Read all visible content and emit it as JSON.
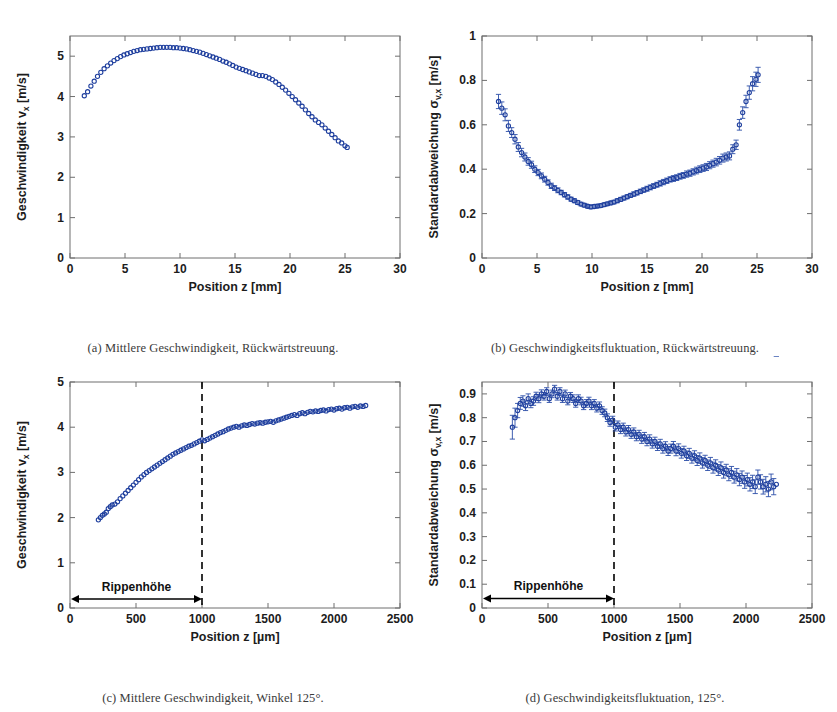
{
  "figure": {
    "background": "#ffffff",
    "series_color": "#1f3f9e",
    "marker_shape": "open-circle",
    "panels": [
      "a",
      "b",
      "c",
      "d"
    ]
  },
  "captions": {
    "a": "(a) Mittlere Geschwindigkeit, Rückwärtstreuung.",
    "b": "(b) Geschwindigkeitsfluktuation, Rückwärtstreuung.",
    "c": "(c) Mittlere Geschwindigkeit, Winkel 125°.",
    "d": "(d) Geschwindigkeitsfluktuation, 125°."
  },
  "annotations": {
    "rippenhoehe_label": "Rippenhöhe"
  },
  "chart_data": [
    {
      "id": "a",
      "type": "scatter",
      "title": "",
      "xlabel": "Position z [mm]",
      "ylabel": "Geschwindigkeit v",
      "ylabel_sub": "x",
      "ylabel_unit": " [m/s]",
      "xlim": [
        0,
        30
      ],
      "ylim": [
        0,
        5.5
      ],
      "xticks": [
        0,
        5,
        10,
        15,
        20,
        25,
        30
      ],
      "xticklabels": [
        "0",
        "5",
        "10",
        "15",
        "20",
        "25",
        "30"
      ],
      "yticks": [
        0,
        1,
        2,
        3,
        4,
        5
      ],
      "yticklabels": [
        "0",
        "1",
        "2",
        "3",
        "4",
        "5"
      ],
      "grid": false,
      "legend": "none",
      "errorbars": false,
      "x": [
        1.3,
        1.6,
        1.9,
        2.2,
        2.5,
        2.8,
        3.1,
        3.4,
        3.7,
        4.0,
        4.3,
        4.6,
        4.9,
        5.2,
        5.5,
        5.8,
        6.1,
        6.4,
        6.7,
        7.0,
        7.3,
        7.6,
        7.9,
        8.2,
        8.5,
        8.8,
        9.1,
        9.4,
        9.7,
        10.0,
        10.3,
        10.6,
        10.9,
        11.2,
        11.5,
        11.8,
        12.1,
        12.4,
        12.7,
        13.0,
        13.3,
        13.6,
        13.9,
        14.2,
        14.5,
        14.8,
        15.1,
        15.4,
        15.7,
        16.0,
        16.3,
        16.6,
        16.9,
        17.2,
        17.5,
        17.8,
        18.1,
        18.4,
        18.7,
        19.0,
        19.3,
        19.6,
        19.9,
        20.2,
        20.5,
        20.8,
        21.1,
        21.4,
        21.7,
        22.0,
        22.3,
        22.6,
        22.9,
        23.2,
        23.5,
        23.8,
        24.1,
        24.4,
        24.7,
        25.0,
        25.2
      ],
      "y": [
        4.02,
        4.12,
        4.26,
        4.38,
        4.5,
        4.6,
        4.69,
        4.76,
        4.83,
        4.89,
        4.94,
        4.99,
        5.03,
        5.06,
        5.09,
        5.12,
        5.14,
        5.16,
        5.17,
        5.18,
        5.19,
        5.2,
        5.21,
        5.22,
        5.22,
        5.22,
        5.22,
        5.21,
        5.21,
        5.2,
        5.19,
        5.18,
        5.16,
        5.14,
        5.12,
        5.1,
        5.07,
        5.04,
        5.01,
        4.98,
        4.95,
        4.92,
        4.88,
        4.85,
        4.81,
        4.77,
        4.73,
        4.7,
        4.67,
        4.64,
        4.61,
        4.58,
        4.55,
        4.52,
        4.52,
        4.5,
        4.46,
        4.42,
        4.36,
        4.3,
        4.23,
        4.16,
        4.08,
        4.0,
        3.92,
        3.84,
        3.76,
        3.67,
        3.58,
        3.5,
        3.42,
        3.36,
        3.3,
        3.22,
        3.14,
        3.06,
        2.98,
        2.9,
        2.85,
        2.78,
        2.74
      ]
    },
    {
      "id": "b",
      "type": "scatter",
      "title": "",
      "xlabel": "Position z [mm]",
      "ylabel": "Standardabweichung σ",
      "ylabel_sub": "v,x",
      "ylabel_unit": " [m/s]",
      "xlim": [
        0,
        30
      ],
      "ylim": [
        0,
        1
      ],
      "xticks": [
        0,
        5,
        10,
        15,
        20,
        25,
        30
      ],
      "xticklabels": [
        "0",
        "5",
        "10",
        "15",
        "20",
        "25",
        "30"
      ],
      "yticks": [
        0,
        0.2,
        0.4,
        0.6,
        0.8,
        1
      ],
      "yticklabels": [
        "0",
        "0.2",
        "0.4",
        "0.6",
        "0.8",
        "1"
      ],
      "grid": false,
      "legend": "none",
      "errorbars": true,
      "x": [
        1.5,
        1.8,
        2.1,
        2.4,
        2.7,
        3.0,
        3.3,
        3.6,
        3.9,
        4.2,
        4.5,
        4.8,
        5.1,
        5.4,
        5.7,
        6.0,
        6.3,
        6.6,
        6.9,
        7.2,
        7.5,
        7.8,
        8.1,
        8.4,
        8.7,
        9.0,
        9.3,
        9.6,
        9.9,
        10.2,
        10.5,
        10.8,
        11.1,
        11.4,
        11.7,
        12.0,
        12.3,
        12.6,
        12.9,
        13.2,
        13.5,
        13.8,
        14.1,
        14.4,
        14.7,
        15.0,
        15.3,
        15.6,
        15.9,
        16.2,
        16.5,
        16.8,
        17.1,
        17.4,
        17.7,
        18.0,
        18.3,
        18.6,
        18.9,
        19.2,
        19.5,
        19.8,
        20.1,
        20.4,
        20.7,
        21.0,
        21.3,
        21.6,
        21.9,
        22.2,
        22.5,
        22.8,
        23.1,
        23.4,
        23.7,
        24.0,
        24.3,
        24.6,
        24.9,
        25.1
      ],
      "y": [
        0.705,
        0.675,
        0.645,
        0.595,
        0.565,
        0.535,
        0.5,
        0.475,
        0.455,
        0.435,
        0.42,
        0.4,
        0.385,
        0.37,
        0.355,
        0.34,
        0.325,
        0.315,
        0.305,
        0.295,
        0.285,
        0.275,
        0.265,
        0.258,
        0.25,
        0.243,
        0.238,
        0.233,
        0.23,
        0.232,
        0.234,
        0.236,
        0.24,
        0.244,
        0.248,
        0.252,
        0.258,
        0.264,
        0.27,
        0.276,
        0.282,
        0.288,
        0.294,
        0.3,
        0.306,
        0.312,
        0.318,
        0.324,
        0.33,
        0.336,
        0.342,
        0.348,
        0.354,
        0.358,
        0.362,
        0.368,
        0.372,
        0.378,
        0.382,
        0.388,
        0.394,
        0.4,
        0.405,
        0.41,
        0.418,
        0.425,
        0.432,
        0.44,
        0.45,
        0.455,
        0.46,
        0.49,
        0.51,
        0.6,
        0.655,
        0.705,
        0.745,
        0.785,
        0.805,
        0.825
      ],
      "yerr": [
        0.032,
        0.028,
        0.027,
        0.025,
        0.022,
        0.021,
        0.02,
        0.019,
        0.018,
        0.017,
        0.016,
        0.015,
        0.014,
        0.013,
        0.013,
        0.012,
        0.012,
        0.011,
        0.011,
        0.01,
        0.01,
        0.01,
        0.009,
        0.009,
        0.009,
        0.008,
        0.008,
        0.008,
        0.008,
        0.008,
        0.008,
        0.008,
        0.008,
        0.008,
        0.008,
        0.008,
        0.009,
        0.009,
        0.009,
        0.009,
        0.009,
        0.01,
        0.01,
        0.01,
        0.01,
        0.011,
        0.011,
        0.011,
        0.011,
        0.012,
        0.012,
        0.012,
        0.012,
        0.013,
        0.013,
        0.013,
        0.013,
        0.014,
        0.014,
        0.014,
        0.015,
        0.015,
        0.015,
        0.016,
        0.016,
        0.016,
        0.017,
        0.017,
        0.018,
        0.018,
        0.018,
        0.02,
        0.021,
        0.024,
        0.026,
        0.028,
        0.03,
        0.032,
        0.032,
        0.034
      ]
    },
    {
      "id": "c",
      "type": "scatter",
      "title": "",
      "xlabel": "Position z [µm]",
      "ylabel": "Geschwindigkeit v",
      "ylabel_sub": "x",
      "ylabel_unit": " [m/s]",
      "xlim": [
        0,
        2500
      ],
      "ylim": [
        0,
        5
      ],
      "xticks": [
        0,
        500,
        1000,
        1500,
        2000,
        2500
      ],
      "xticklabels": [
        "0",
        "500",
        "1000",
        "1500",
        "2000",
        "2500"
      ],
      "yticks": [
        0,
        1,
        2,
        3,
        4,
        5
      ],
      "yticklabels": [
        "0",
        "1",
        "2",
        "3",
        "4",
        "5"
      ],
      "grid": false,
      "legend": "none",
      "errorbars": false,
      "reference_line_x": 1000,
      "annotation": {
        "label": "Rippenhöhe",
        "from_x": 0,
        "to_x": 1000,
        "at_y": 0.2
      },
      "x": [
        215,
        230,
        245,
        260,
        275,
        290,
        305,
        320,
        340,
        360,
        380,
        400,
        420,
        440,
        460,
        480,
        500,
        520,
        540,
        560,
        580,
        600,
        620,
        640,
        660,
        680,
        700,
        720,
        740,
        760,
        780,
        800,
        820,
        840,
        860,
        880,
        900,
        920,
        940,
        960,
        980,
        1000,
        1020,
        1040,
        1060,
        1080,
        1100,
        1120,
        1140,
        1160,
        1180,
        1200,
        1220,
        1240,
        1260,
        1280,
        1300,
        1320,
        1340,
        1360,
        1380,
        1400,
        1420,
        1440,
        1460,
        1480,
        1500,
        1520,
        1540,
        1560,
        1580,
        1600,
        1620,
        1640,
        1660,
        1680,
        1700,
        1720,
        1740,
        1760,
        1780,
        1800,
        1820,
        1840,
        1860,
        1880,
        1900,
        1920,
        1940,
        1960,
        1980,
        2000,
        2020,
        2040,
        2060,
        2080,
        2100,
        2120,
        2140,
        2160,
        2180,
        2200,
        2220,
        2240
      ],
      "y": [
        1.95,
        2.0,
        2.05,
        2.08,
        2.12,
        2.2,
        2.24,
        2.28,
        2.3,
        2.35,
        2.42,
        2.48,
        2.54,
        2.6,
        2.66,
        2.72,
        2.78,
        2.84,
        2.9,
        2.95,
        3.0,
        3.04,
        3.08,
        3.12,
        3.16,
        3.2,
        3.24,
        3.28,
        3.32,
        3.36,
        3.4,
        3.43,
        3.46,
        3.49,
        3.52,
        3.55,
        3.58,
        3.6,
        3.63,
        3.66,
        3.69,
        3.72,
        3.7,
        3.73,
        3.76,
        3.79,
        3.82,
        3.85,
        3.88,
        3.9,
        3.93,
        3.96,
        3.98,
        4.0,
        4.02,
        4.0,
        4.03,
        4.05,
        4.04,
        4.06,
        4.08,
        4.07,
        4.09,
        4.1,
        4.09,
        4.11,
        4.12,
        4.13,
        4.11,
        4.14,
        4.16,
        4.18,
        4.2,
        4.22,
        4.24,
        4.26,
        4.28,
        4.26,
        4.3,
        4.32,
        4.3,
        4.33,
        4.35,
        4.34,
        4.36,
        4.35,
        4.37,
        4.38,
        4.36,
        4.39,
        4.4,
        4.38,
        4.41,
        4.42,
        4.4,
        4.43,
        4.44,
        4.42,
        4.45,
        4.46,
        4.44,
        4.47,
        4.46,
        4.48
      ]
    },
    {
      "id": "d",
      "type": "scatter",
      "title": "",
      "xlabel": "Position z [µm]",
      "ylabel": "Standardabweichung σ",
      "ylabel_sub": "v,x",
      "ylabel_unit": " [m/s]",
      "xlim": [
        0,
        2500
      ],
      "ylim": [
        0,
        0.95
      ],
      "xticks": [
        0,
        500,
        1000,
        1500,
        2000,
        2500
      ],
      "xticklabels": [
        "0",
        "500",
        "1000",
        "1500",
        "2000",
        "2500"
      ],
      "yticks": [
        0,
        0.1,
        0.2,
        0.3,
        0.4,
        0.5,
        0.6,
        0.7,
        0.8,
        0.9
      ],
      "yticklabels": [
        "0",
        "0.1",
        "0.2",
        "0.3",
        "0.4",
        "0.5",
        "0.6",
        "0.7",
        "0.8",
        "0.9"
      ],
      "grid": false,
      "legend": "none",
      "errorbars": true,
      "reference_line_x": 1000,
      "annotation": {
        "label": "Rippenhöhe",
        "from_x": 0,
        "to_x": 1000,
        "at_y": 0.04
      },
      "x": [
        230,
        250,
        270,
        290,
        310,
        330,
        350,
        370,
        390,
        410,
        430,
        450,
        470,
        490,
        510,
        530,
        550,
        570,
        590,
        610,
        630,
        650,
        670,
        690,
        710,
        730,
        750,
        770,
        790,
        810,
        830,
        850,
        870,
        890,
        910,
        930,
        950,
        970,
        990,
        1010,
        1030,
        1050,
        1070,
        1090,
        1110,
        1130,
        1150,
        1170,
        1190,
        1210,
        1230,
        1250,
        1270,
        1290,
        1310,
        1330,
        1350,
        1370,
        1390,
        1410,
        1430,
        1450,
        1470,
        1490,
        1510,
        1530,
        1550,
        1570,
        1590,
        1610,
        1630,
        1650,
        1670,
        1690,
        1710,
        1730,
        1750,
        1770,
        1790,
        1810,
        1830,
        1850,
        1870,
        1890,
        1910,
        1930,
        1950,
        1970,
        1990,
        2010,
        2030,
        2050,
        2070,
        2090,
        2110,
        2130,
        2150,
        2170,
        2190,
        2210,
        2230
      ],
      "y": [
        0.76,
        0.8,
        0.83,
        0.86,
        0.87,
        0.85,
        0.88,
        0.86,
        0.87,
        0.89,
        0.88,
        0.9,
        0.89,
        0.91,
        0.88,
        0.9,
        0.92,
        0.89,
        0.91,
        0.88,
        0.9,
        0.87,
        0.89,
        0.88,
        0.86,
        0.88,
        0.87,
        0.85,
        0.86,
        0.87,
        0.85,
        0.86,
        0.84,
        0.85,
        0.83,
        0.82,
        0.8,
        0.78,
        0.79,
        0.76,
        0.77,
        0.75,
        0.76,
        0.74,
        0.75,
        0.73,
        0.74,
        0.72,
        0.73,
        0.71,
        0.72,
        0.7,
        0.71,
        0.69,
        0.7,
        0.68,
        0.69,
        0.67,
        0.68,
        0.66,
        0.67,
        0.68,
        0.66,
        0.67,
        0.65,
        0.66,
        0.64,
        0.65,
        0.63,
        0.64,
        0.62,
        0.63,
        0.61,
        0.62,
        0.6,
        0.61,
        0.59,
        0.6,
        0.58,
        0.59,
        0.57,
        0.58,
        0.56,
        0.57,
        0.55,
        0.56,
        0.54,
        0.55,
        0.53,
        0.54,
        0.52,
        0.53,
        0.51,
        0.55,
        0.53,
        0.51,
        0.52,
        0.5,
        0.53,
        0.51,
        0.52
      ],
      "yerr": [
        0.05,
        0.04,
        0.03,
        0.025,
        0.022,
        0.02,
        0.02,
        0.018,
        0.018,
        0.017,
        0.017,
        0.017,
        0.016,
        0.016,
        0.016,
        0.016,
        0.016,
        0.016,
        0.016,
        0.016,
        0.016,
        0.016,
        0.016,
        0.016,
        0.016,
        0.016,
        0.016,
        0.016,
        0.016,
        0.016,
        0.016,
        0.016,
        0.016,
        0.016,
        0.016,
        0.016,
        0.016,
        0.016,
        0.016,
        0.016,
        0.016,
        0.017,
        0.017,
        0.017,
        0.017,
        0.017,
        0.017,
        0.017,
        0.017,
        0.018,
        0.018,
        0.018,
        0.018,
        0.018,
        0.018,
        0.018,
        0.019,
        0.019,
        0.019,
        0.019,
        0.019,
        0.02,
        0.02,
        0.02,
        0.02,
        0.02,
        0.02,
        0.021,
        0.021,
        0.021,
        0.021,
        0.022,
        0.022,
        0.022,
        0.022,
        0.023,
        0.023,
        0.023,
        0.023,
        0.024,
        0.024,
        0.024,
        0.025,
        0.025,
        0.025,
        0.026,
        0.026,
        0.026,
        0.027,
        0.027,
        0.028,
        0.028,
        0.029,
        0.03,
        0.03,
        0.031,
        0.032,
        0.032,
        0.033,
        0.034
      ]
    }
  ]
}
